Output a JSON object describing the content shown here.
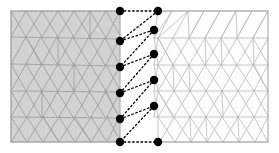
{
  "figure": {
    "background_color": "#ffffff",
    "width": 279,
    "height": 153
  },
  "style": {
    "left_domain_fill": "#d2d2d2",
    "right_domain_fill": "#fdfdfd",
    "left_edge_color": "#9a9a9a",
    "right_edge_color": "#b9b9b9",
    "boundary_color": "#a8a8a8",
    "node_color": "#000000",
    "interface_line_color": "#000000",
    "node_radius": 4.2,
    "edge_width": 0.8,
    "boundary_width": 1.1,
    "interface_dash": "1.6 2.6",
    "interface_width": 1.3
  },
  "chart_data": {
    "type": "diagram",
    "subtype": "mesh",
    "domains": [
      {
        "name": "left-domain",
        "fill": "#d2d2d2",
        "bounds": [
          11,
          11,
          120,
          142
        ],
        "description": "gray shaded unstructured triangular mesh"
      },
      {
        "name": "right-domain",
        "fill": "#fdfdfd",
        "bounds": [
          120,
          11,
          268,
          142
        ],
        "description": "white unstructured triangular mesh"
      }
    ],
    "interface_nodes_left": [
      {
        "x": 120,
        "y": 11
      },
      {
        "x": 120,
        "y": 41
      },
      {
        "x": 120,
        "y": 67
      },
      {
        "x": 120,
        "y": 93
      },
      {
        "x": 120,
        "y": 119
      },
      {
        "x": 120,
        "y": 142
      }
    ],
    "interface_nodes_right": [
      {
        "x": 158,
        "y": 11
      },
      {
        "x": 154,
        "y": 30
      },
      {
        "x": 154,
        "y": 54
      },
      {
        "x": 154,
        "y": 80
      },
      {
        "x": 154,
        "y": 106
      },
      {
        "x": 158,
        "y": 142
      }
    ],
    "interface_polyline": [
      [
        120,
        11
      ],
      [
        158,
        11
      ],
      [
        120,
        41
      ],
      [
        154,
        30
      ],
      [
        120,
        67
      ],
      [
        154,
        54
      ],
      [
        120,
        93
      ],
      [
        154,
        80
      ],
      [
        120,
        119
      ],
      [
        154,
        106
      ],
      [
        120,
        142
      ],
      [
        158,
        142
      ]
    ],
    "node_count": 12,
    "xlabel": "",
    "ylabel": "",
    "grid": false,
    "legend": []
  }
}
